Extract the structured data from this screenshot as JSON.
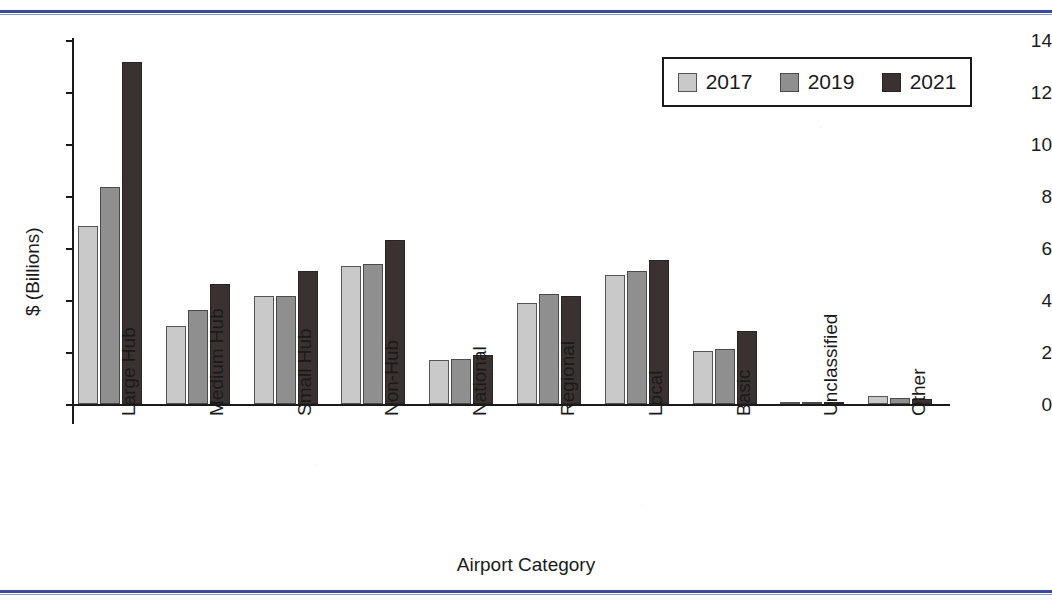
{
  "decorations": {
    "top_rule_color": "#3a4a96",
    "bottom_rule_color": "#3a4a96"
  },
  "legend": {
    "position": "top-right",
    "entries": [
      {
        "label": "2017",
        "color": "#c9c9c9"
      },
      {
        "label": "2019",
        "color": "#8f8f8f"
      },
      {
        "label": "2021",
        "color": "#3a3230"
      }
    ]
  },
  "axes": {
    "ylabel": "$ (Billions)",
    "xlabel": "Airport Category",
    "yticks": [
      "0",
      "2",
      "4",
      "6",
      "8",
      "10",
      "12",
      "14"
    ]
  },
  "chart_data": {
    "type": "bar",
    "title": "",
    "subtitle": "",
    "xlabel": "Airport Category",
    "ylabel": "$ (Billions)",
    "ylim": [
      0,
      14
    ],
    "ytick_step": 2,
    "grid": false,
    "legend_position": "upper right",
    "categories": [
      "Large Hub",
      "Medium Hub",
      "Small Hub",
      "Non-Hub",
      "National",
      "Regional",
      "Local",
      "Basic",
      "Unclassified",
      "Other"
    ],
    "series": [
      {
        "name": "2017",
        "color": "#c9c9c9",
        "values": [
          6.85,
          3.0,
          4.15,
          5.3,
          1.7,
          3.9,
          4.95,
          2.05,
          0.02,
          0.3
        ]
      },
      {
        "name": "2019",
        "color": "#8f8f8f",
        "values": [
          8.35,
          3.6,
          4.15,
          5.4,
          1.75,
          4.25,
          5.1,
          2.1,
          0.02,
          0.25
        ]
      },
      {
        "name": "2021",
        "color": "#3a3230",
        "values": [
          13.15,
          4.6,
          5.1,
          6.3,
          1.9,
          4.15,
          5.55,
          2.8,
          0.02,
          0.2
        ]
      }
    ]
  }
}
